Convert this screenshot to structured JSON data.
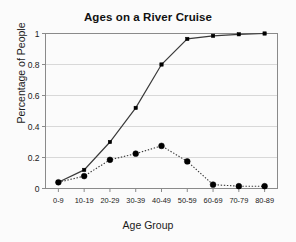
{
  "chart_data": {
    "type": "line",
    "title": "Ages on a River Cruise",
    "xlabel": "Age Group",
    "ylabel": "Percentage of People",
    "categories": [
      "0-9",
      "10-19",
      "20-29",
      "30-39",
      "40-49",
      "50-59",
      "60-69",
      "70-79",
      "80-89"
    ],
    "series": [
      {
        "name": "cumulative",
        "style": "solid",
        "marker": "square",
        "values": [
          0.04,
          0.12,
          0.3,
          0.52,
          0.8,
          0.965,
          0.985,
          0.995,
          1.0
        ]
      },
      {
        "name": "distribution",
        "style": "dotted",
        "marker": "circle",
        "values": [
          0.04,
          0.08,
          0.185,
          0.225,
          0.275,
          0.175,
          0.025,
          0.015,
          0.015
        ]
      }
    ],
    "ylim": [
      0,
      1
    ],
    "yticks": [
      0,
      0.2,
      0.4,
      0.6,
      0.8,
      1
    ],
    "ytick_labels": [
      "0",
      "0.2",
      "0.4",
      "0.6",
      "0.8",
      "1"
    ],
    "grid": true,
    "legend": "none",
    "colors": {
      "line": "#3a3a3a",
      "marker": "#000000",
      "grid": "#d8d8d8",
      "axis": "#8a8a8a",
      "background": "#fbfbfb",
      "text": "#1a1a1a"
    }
  }
}
